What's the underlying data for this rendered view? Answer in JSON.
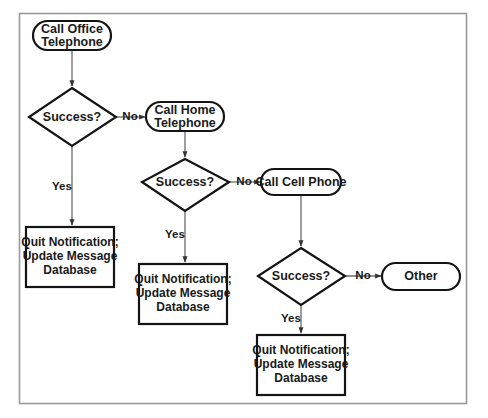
{
  "diagram": {
    "background_color": "#ffffff",
    "frame_color": "#9a9a9a",
    "shape_stroke_color": "#141414",
    "connector_color": "#6b6b6b",
    "text_color": "#1a1a1a"
  },
  "nodes": {
    "start_office": {
      "type": "terminator",
      "line1": "Call Office",
      "line2": "Telephone"
    },
    "decision_1": {
      "type": "decision",
      "label": "Success?"
    },
    "call_home": {
      "type": "terminator",
      "line1": "Call Home",
      "line2": "Telephone"
    },
    "decision_2": {
      "type": "decision",
      "label": "Success?"
    },
    "call_cell": {
      "type": "terminator",
      "line1": "Call Cell Phone",
      "line2": ""
    },
    "decision_3": {
      "type": "decision",
      "label": "Success?"
    },
    "other": {
      "type": "terminator",
      "line1": "Other",
      "line2": ""
    },
    "quit_1": {
      "type": "process",
      "line1": "Quit Notification;",
      "line2": "Update Message",
      "line3": "Database"
    },
    "quit_2": {
      "type": "process",
      "line1": "Quit Notification;",
      "line2": "Update Message",
      "line3": "Database"
    },
    "quit_3": {
      "type": "process",
      "line1": "Quit Notification;",
      "line2": "Update Message",
      "line3": "Database"
    }
  },
  "edge_labels": {
    "d1_no": "No",
    "d1_yes": "Yes",
    "d2_no": "No",
    "d2_yes": "Yes",
    "d3_no": "No",
    "d3_yes": "Yes"
  }
}
